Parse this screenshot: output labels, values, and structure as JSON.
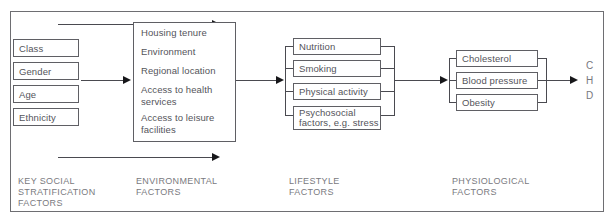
{
  "diagram": {
    "stages": [
      {
        "id": "key-social-stratification",
        "caption": "KEY SOCIAL\nSTRATIFICATION\nFACTORS",
        "items": [
          {
            "label": "Class"
          },
          {
            "label": "Gender"
          },
          {
            "label": "Age"
          },
          {
            "label": "Ethnicity"
          }
        ]
      },
      {
        "id": "environmental",
        "caption": "ENVIRONMENTAL\nFACTORS",
        "items": [
          {
            "label": "Housing tenure"
          },
          {
            "label": "Environment"
          },
          {
            "label": "Regional location"
          },
          {
            "label": "Access to health\nservices"
          },
          {
            "label": "Access to leisure\nfacilities"
          }
        ]
      },
      {
        "id": "lifestyle",
        "caption": "LIFESTYLE\nFACTORS",
        "items": [
          {
            "label": "Nutrition"
          },
          {
            "label": "Smoking"
          },
          {
            "label": "Physical activity"
          },
          {
            "label": "Psychosocial\nfactors, e.g. stress"
          }
        ]
      },
      {
        "id": "physiological",
        "caption": "PHYSIOLOGICAL\nFACTORS",
        "items": [
          {
            "label": "Cholesterol"
          },
          {
            "label": "Blood pressure"
          },
          {
            "label": "Obesity"
          }
        ]
      }
    ],
    "outcome": {
      "lines": [
        "C",
        "H",
        "D"
      ]
    },
    "colors": {
      "frame_stroke": "#6e6e72",
      "box_stroke": "#5f5f64",
      "connector_stroke": "#4a4a50",
      "arrowhead_fill": "#17171a",
      "box_text": "#54545a",
      "caption_text": "#7a7a80",
      "background": "#ffffff"
    }
  }
}
